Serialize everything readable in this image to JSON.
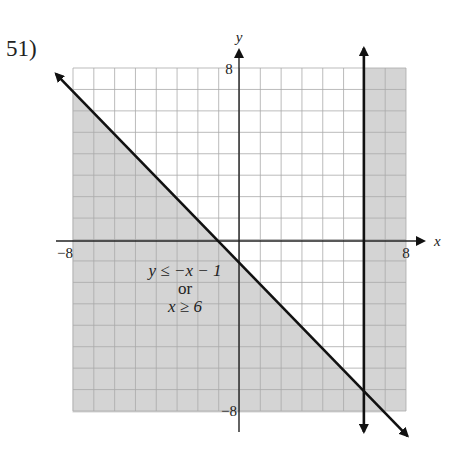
{
  "problem": {
    "number": "51)"
  },
  "chart_data": {
    "type": "inequality-graph",
    "title": "",
    "xlabel": "x",
    "ylabel": "y",
    "xlim": [
      -8,
      8
    ],
    "ylim": [
      -8,
      8
    ],
    "grid": true,
    "tick_labels": {
      "x_min": "−8",
      "x_max": "8",
      "y_max": "8",
      "y_min": "−8"
    },
    "lines": [
      {
        "equation": "y = -x - 1",
        "style": "solid",
        "arrows": "both"
      },
      {
        "equation": "x = 6",
        "style": "solid",
        "arrows": "both"
      }
    ],
    "shaded_region": "y <= -x - 1 or x >= 6",
    "annotation": {
      "line1": "y ≤ −x − 1",
      "line2": "or",
      "line3": "x ≥ 6"
    },
    "colors": {
      "shade": "#d4d4d4",
      "grid": "#a9a9a9",
      "line": "#111111",
      "axis": "#222222"
    }
  }
}
